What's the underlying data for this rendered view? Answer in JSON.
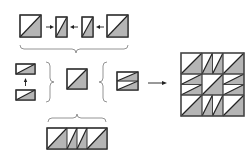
{
  "diagram": {
    "title": "",
    "colors": {
      "background": "#ffffff",
      "fabric_light": "#ffffff",
      "fabric_dark": "#b5b5b5",
      "outline": "#333333",
      "brace": "#888888"
    },
    "steps": [
      {
        "id": "top-row",
        "label": "",
        "parts": [
          "half-square-triangle",
          "narrow-triangle-rect",
          "narrow-triangle-rect",
          "half-square-triangle"
        ]
      },
      {
        "id": "left-stack",
        "label": "",
        "parts": [
          "flat-triangle-rect",
          "flat-triangle-rect"
        ]
      },
      {
        "id": "center-unit",
        "label": "",
        "parts": [
          "half-square-triangle"
        ]
      },
      {
        "id": "right-stack",
        "label": "",
        "parts": [
          "stacked-flat-triangle-rects"
        ]
      },
      {
        "id": "bottom-strip",
        "label": "",
        "parts": [
          "half-square-triangle",
          "narrow-triangle-rect",
          "narrow-triangle-rect",
          "half-square-triangle"
        ]
      },
      {
        "id": "final-block",
        "label": "",
        "grid": "3x3"
      }
    ]
  }
}
